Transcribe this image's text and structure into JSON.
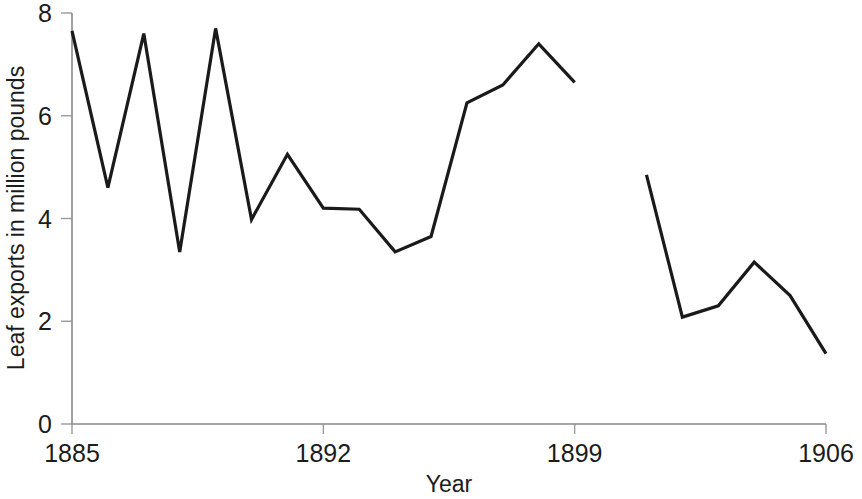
{
  "chart_data": {
    "type": "line",
    "title": "",
    "xlabel": "Year",
    "ylabel": "Leaf exports in million pounds",
    "xlim": [
      1885,
      1906
    ],
    "ylim": [
      0,
      8
    ],
    "grid": false,
    "legend": "none",
    "x_ticks": [
      1885,
      1892,
      1899,
      1906
    ],
    "x_tick_labels": [
      "1885",
      "1892",
      "1899",
      "1906"
    ],
    "y_ticks": [
      0,
      2,
      4,
      6,
      8
    ],
    "y_tick_labels": [
      "0",
      "2",
      "4",
      "6",
      "8"
    ],
    "line_color": "#1a1a1a",
    "axis_color": "#8a8a8a",
    "series": [
      {
        "name": "Leaf exports",
        "note": "first segment 1885-1899",
        "x": [
          1885,
          1886,
          1887,
          1888,
          1889,
          1890,
          1891,
          1892,
          1893,
          1894,
          1895,
          1896,
          1897,
          1898,
          1899
        ],
        "values": [
          7.65,
          4.6,
          7.6,
          3.35,
          7.7,
          3.98,
          5.25,
          4.2,
          4.18,
          3.35,
          3.65,
          6.25,
          6.6,
          7.4,
          6.65
        ]
      },
      {
        "name": "Leaf exports",
        "note": "second segment 1901-1906 after data gap",
        "x": [
          1901,
          1902,
          1903,
          1904,
          1905,
          1906
        ],
        "values": [
          4.85,
          2.08,
          2.3,
          3.15,
          2.5,
          1.37
        ]
      }
    ]
  },
  "axis": {
    "y_title": "Leaf exports in million pounds",
    "x_title": "Year"
  },
  "geometry": {
    "plot_left": 72,
    "plot_right": 826,
    "plot_top": 13,
    "plot_bottom": 424
  }
}
